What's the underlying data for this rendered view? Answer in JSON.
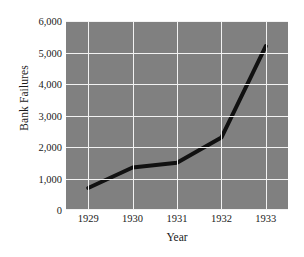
{
  "chart_data": {
    "type": "line",
    "title": "",
    "xlabel": "Year",
    "ylabel": "Bank Failures",
    "x": [
      1929,
      1930,
      1931,
      1932,
      1933
    ],
    "categories": [
      "1929",
      "1930",
      "1931",
      "1932",
      "1933"
    ],
    "values": [
      700,
      1350,
      1500,
      2300,
      5200
    ],
    "series": [
      {
        "name": "Bank Failures",
        "values": [
          700,
          1350,
          1500,
          2300,
          5200
        ]
      }
    ],
    "xlim": [
      1928.5,
      1933.5
    ],
    "ylim": [
      0,
      6000
    ],
    "ytick_labels": [
      "0",
      "1,000",
      "2,000",
      "3,000",
      "4,000",
      "5,000",
      "6,000"
    ],
    "ytick_values": [
      0,
      1000,
      2000,
      3000,
      4000,
      5000,
      6000
    ],
    "xtick_labels": [
      "1929",
      "1930",
      "1931",
      "1932",
      "1933"
    ],
    "grid": true,
    "legend": "none",
    "colors": {
      "panel_background": "#808080",
      "gridline": "#f2f2f2",
      "series_line": "#111111",
      "text": "#1a1a1a",
      "figure_background": "#ffffff"
    },
    "style": {
      "line_width_px": 4,
      "markers": "none"
    }
  }
}
